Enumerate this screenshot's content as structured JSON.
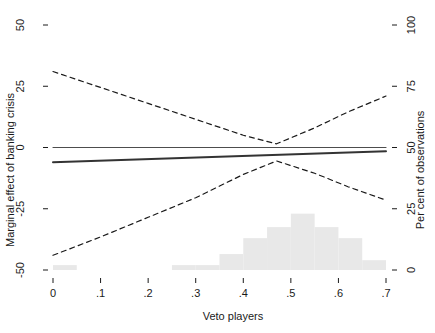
{
  "chart_data": {
    "type": "line",
    "title": "",
    "subtitle": "",
    "xlabel": "Veto players",
    "ylabel": "Marginal effect of banking crisis",
    "ylabel_right": "Per cent of observations",
    "xlim": [
      0,
      0.7
    ],
    "ylim": [
      -50,
      50
    ],
    "ylim_right": [
      0,
      100
    ],
    "grid": false,
    "legend": "none",
    "xticks": [
      0,
      0.1,
      0.2,
      0.3,
      0.4,
      0.5,
      0.6,
      0.7
    ],
    "xticklabels": [
      "0",
      ".1",
      ".2",
      ".3",
      ".4",
      ".5",
      ".6",
      ".7"
    ],
    "yticks": [
      -50,
      -25,
      0,
      25,
      50
    ],
    "yticklabels": [
      "-50",
      "-25",
      "0",
      "25",
      "50"
    ],
    "yticks_right": [
      0,
      25,
      50,
      75,
      100
    ],
    "yticklabels_right": [
      "0",
      "25",
      "50",
      "75",
      "100"
    ],
    "series": [
      {
        "name": "zero-reference-line",
        "style": "solid",
        "width": 1.1,
        "color": "#4d4d4d",
        "x": [
          0.0,
          0.7
        ],
        "values": [
          0,
          0
        ]
      },
      {
        "name": "marginal-effect-estimate",
        "style": "solid",
        "width": 2.0,
        "color": "#333333",
        "x": [
          0.0,
          0.7
        ],
        "values": [
          -6.0,
          -1.5
        ]
      },
      {
        "name": "upper-confidence-bound",
        "style": "dashed",
        "width": 1.2,
        "color": "#1a1a1a",
        "x": [
          0.0,
          0.1,
          0.2,
          0.3,
          0.4,
          0.47,
          0.55,
          0.62,
          0.7
        ],
        "values": [
          31.0,
          24.5,
          18.0,
          11.5,
          5.0,
          1.5,
          8.0,
          14.5,
          21.0
        ]
      },
      {
        "name": "lower-confidence-bound",
        "style": "dashed",
        "width": 1.2,
        "color": "#1a1a1a",
        "x": [
          0.0,
          0.1,
          0.2,
          0.3,
          0.4,
          0.47,
          0.55,
          0.62,
          0.7
        ],
        "values": [
          -44.0,
          -36.5,
          -28.5,
          -20.5,
          -11.0,
          -5.5,
          -10.5,
          -16.0,
          -21.5
        ]
      }
    ],
    "histogram": {
      "name": "veto-players-distribution",
      "color": "#e8e8e8",
      "axis": "right",
      "bin_edges": [
        0.0,
        0.05,
        0.1,
        0.15,
        0.2,
        0.25,
        0.3,
        0.35,
        0.4,
        0.45,
        0.5,
        0.55,
        0.6,
        0.65,
        0.7
      ],
      "values": [
        2.0,
        0.0,
        0.0,
        0.0,
        0.0,
        2.0,
        2.0,
        6.5,
        13.0,
        17.5,
        23.0,
        17.5,
        13.0,
        4.0,
        2.0
      ]
    }
  }
}
